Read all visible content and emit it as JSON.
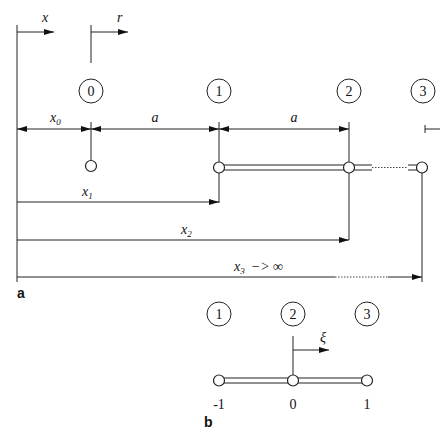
{
  "panel_a": {
    "label": "a",
    "axis_x": "x",
    "axis_r": "r",
    "nodes": [
      "0",
      "1",
      "2",
      "3"
    ],
    "dim_x0": "x",
    "dim_x0_sub": "0",
    "dim_a1": "a",
    "dim_a2": "a",
    "dim_x1": "x",
    "dim_x1_sub": "1",
    "dim_x2": "x",
    "dim_x2_sub": "2",
    "dim_x3": "x",
    "dim_x3_sub": "3",
    "dim_x3_suffix": "−> ∞"
  },
  "panel_b": {
    "label": "b",
    "axis_xi": "ξ",
    "nodes": [
      "1",
      "2",
      "3"
    ],
    "ticks": [
      "-1",
      "0",
      "1"
    ]
  },
  "colors": {
    "ink": "#222222",
    "background": "#ffffff"
  }
}
